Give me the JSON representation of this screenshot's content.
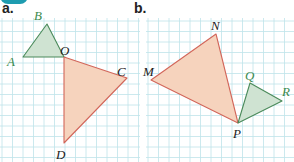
{
  "figure": {
    "background": "#ffffff",
    "grid": {
      "spacing": 10.5,
      "color": "#bfe3ea",
      "regions": [
        {
          "x": 0,
          "y": 18,
          "width": 140,
          "height": 144
        },
        {
          "x": 146,
          "y": 18,
          "width": 148,
          "height": 144
        }
      ]
    },
    "colors": {
      "green_fill": "#cfe3d2",
      "green_stroke": "#4a8a5a",
      "green_label": "#3c8a4e",
      "orange_fill": "#f6d3bd",
      "orange_stroke": "#d2665a",
      "dark_label": "#222222",
      "accent_tab": "#1e9cb0"
    }
  },
  "parts": [
    {
      "label": "a.",
      "label_pos": [
        2,
        13
      ],
      "triangles": [
        {
          "name": "triangle-ABO",
          "color": "green",
          "vertices": {
            "A": [
              23,
              57
            ],
            "B": [
              47,
              24
            ],
            "O": [
              64,
              57
            ]
          }
        },
        {
          "name": "triangle-COD",
          "color": "orange",
          "vertices": {
            "O": [
              64,
              57
            ],
            "C": [
              127,
              78
            ],
            "D": [
              64,
              143
            ]
          }
        }
      ],
      "vertex_labels": [
        {
          "text": "B",
          "x": 34,
          "y": 20,
          "color": "green"
        },
        {
          "text": "A",
          "x": 7,
          "y": 66,
          "color": "green"
        },
        {
          "text": "O",
          "x": 60,
          "y": 55,
          "color": "dark"
        },
        {
          "text": "C",
          "x": 117,
          "y": 76,
          "color": "dark"
        },
        {
          "text": "D",
          "x": 56,
          "y": 159,
          "color": "dark"
        }
      ]
    },
    {
      "label": "b.",
      "label_pos": [
        134,
        13
      ],
      "triangles": [
        {
          "name": "triangle-MNP",
          "color": "orange",
          "vertices": {
            "M": [
              151,
              80
            ],
            "N": [
              216,
              34
            ],
            "P": [
              238,
              123
            ]
          }
        },
        {
          "name": "triangle-QRP",
          "color": "green",
          "vertices": {
            "Q": [
              250,
              83
            ],
            "R": [
              282,
              101
            ],
            "P": [
              238,
              123
            ]
          }
        }
      ],
      "vertex_labels": [
        {
          "text": "N",
          "x": 211,
          "y": 30,
          "color": "dark"
        },
        {
          "text": "M",
          "x": 143,
          "y": 76,
          "color": "dark"
        },
        {
          "text": "Q",
          "x": 245,
          "y": 80,
          "color": "green"
        },
        {
          "text": "R",
          "x": 282,
          "y": 96,
          "color": "green"
        },
        {
          "text": "P",
          "x": 233,
          "y": 138,
          "color": "dark"
        }
      ]
    }
  ]
}
